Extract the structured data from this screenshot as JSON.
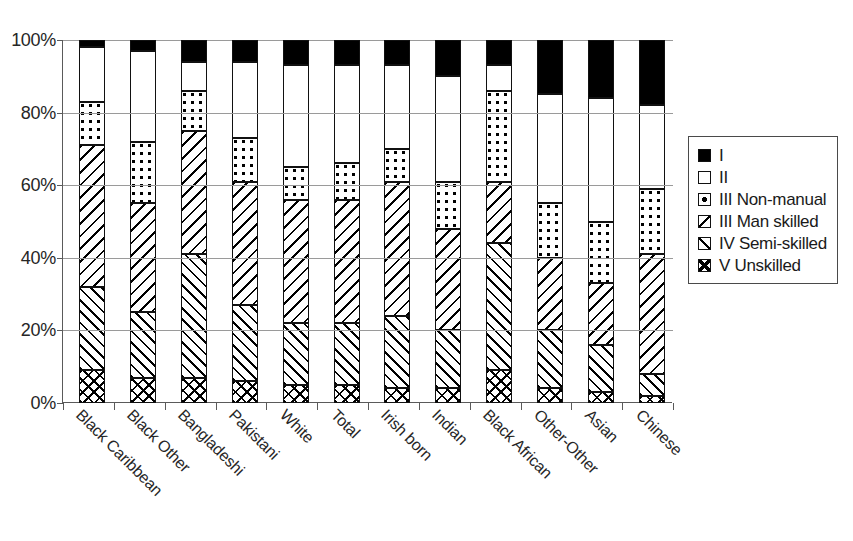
{
  "chart_data": {
    "type": "bar",
    "subtype": "stacked-100-percent",
    "title": "",
    "xlabel": "",
    "ylabel": "",
    "ylim": [
      0,
      100
    ],
    "ytick_labels": [
      "0%",
      "20%",
      "40%",
      "60%",
      "80%",
      "100%"
    ],
    "ytick_values": [
      0,
      20,
      40,
      60,
      80,
      100
    ],
    "grid": "horizontal",
    "legend_position": "right",
    "categories": [
      "Black Caribbean",
      "Black Other",
      "Bangladeshi",
      "Pakistani",
      "White",
      "Total",
      "Irish born",
      "Indian",
      "Black African",
      "Other-Other",
      "Asian",
      "Chinese"
    ],
    "series": [
      {
        "name": "V Unskilled",
        "pattern": "cross-hatch",
        "values": [
          9,
          7,
          7,
          6,
          5,
          5,
          4,
          4,
          9,
          4,
          3,
          2
        ]
      },
      {
        "name": "IV Semi-skilled",
        "pattern": "forward-hatch",
        "values": [
          23,
          18,
          34,
          21,
          17,
          17,
          20,
          16,
          35,
          16,
          13,
          6
        ]
      },
      {
        "name": "III Man skilled",
        "pattern": "back-hatch",
        "values": [
          39,
          30,
          34,
          34,
          34,
          34,
          37,
          28,
          17,
          20,
          17,
          33
        ]
      },
      {
        "name": "III Non-manual",
        "pattern": "dots",
        "values": [
          12,
          17,
          11,
          12,
          9,
          10,
          9,
          13,
          25,
          15,
          17,
          18
        ]
      },
      {
        "name": "II",
        "pattern": "white",
        "values": [
          15,
          25,
          8,
          21,
          28,
          27,
          23,
          29,
          7,
          30,
          34,
          23
        ]
      },
      {
        "name": "I",
        "pattern": "solid-black",
        "values": [
          2,
          3,
          6,
          6,
          7,
          7,
          7,
          10,
          7,
          15,
          16,
          18
        ]
      }
    ]
  },
  "legend": {
    "items": [
      {
        "label": "I",
        "swatch": "solid-black-swatch"
      },
      {
        "label": "II",
        "swatch": "white-swatch"
      },
      {
        "label": "III Non-manual",
        "swatch": "dotted-swatch"
      },
      {
        "label": "III Man skilled",
        "swatch": "back-hatch-swatch"
      },
      {
        "label": "IV Semi-skilled",
        "swatch": "forward-hatch-swatch"
      },
      {
        "label": "V Unskilled",
        "swatch": "cross-hatch-swatch"
      }
    ]
  },
  "colors": {
    "axis": "#5a5a5a",
    "gridline": "#9a9a9a",
    "text": "#262626",
    "bar_outline": "#111111",
    "background": "#ffffff"
  }
}
